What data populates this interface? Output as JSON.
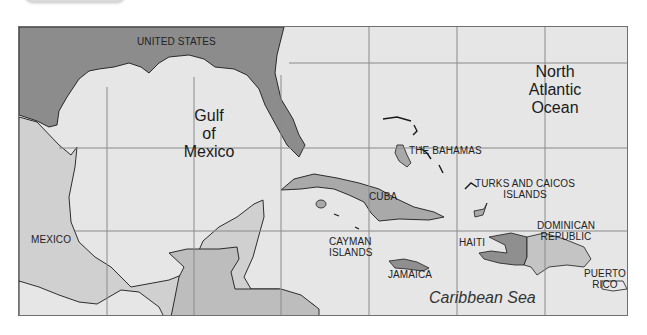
{
  "map": {
    "title": "Caribbean Region Map",
    "colors": {
      "water": "#e6e6e6",
      "us_land": "#8c8c8c",
      "mexico_land": "#d0d0d0",
      "central_america_land": "#bdbdbd",
      "island_land": "#a9a9a9",
      "haiti_land": "#8f8f8f",
      "dominican_land": "#c4c4c4",
      "puerto_rico_land": "#e8e8e8",
      "grid": "#8a8a8a",
      "coast": "#1a1a1a"
    },
    "water_labels": {
      "gulf": [
        "Gulf",
        "of",
        "Mexico"
      ],
      "atlantic": [
        "North",
        "Atlantic",
        "Ocean"
      ],
      "caribbean": "Caribbean Sea"
    },
    "country_labels": {
      "united_states": "UNITED STATES",
      "mexico": "MEXICO",
      "the_bahamas": "THE BAHAMAS",
      "cuba": "CUBA",
      "turks_caicos": [
        "TURKS AND CAICOS",
        "ISLANDS"
      ],
      "cayman": [
        "CAYMAN",
        "ISLANDS"
      ],
      "jamaica": "JAMAICA",
      "haiti": "HAITI",
      "dominican": [
        "DOMINICAN",
        "REPUBLIC"
      ],
      "puerto_rico": [
        "PUERTO",
        "RICO"
      ]
    },
    "grid": {
      "vertical_x": [
        88,
        175,
        262,
        350,
        438,
        526
      ],
      "horizontal_y": [
        36,
        121,
        204
      ]
    }
  }
}
